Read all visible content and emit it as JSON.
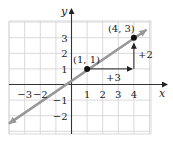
{
  "chart_data": {
    "type": "line",
    "title": "",
    "xlabel": "x",
    "ylabel": "y",
    "xlim": [
      -4,
      5
    ],
    "ylim": [
      -3,
      4
    ],
    "grid": true,
    "x_ticks": [
      -3,
      -2,
      1,
      2,
      3,
      4
    ],
    "x_tick_labels": [
      "−3",
      "−2",
      "1",
      "2",
      "3",
      "4"
    ],
    "y_ticks": [
      -2,
      -1,
      1,
      2,
      3
    ],
    "y_tick_labels": [
      "−2",
      "−1",
      "1",
      "2",
      "3"
    ],
    "series": [
      {
        "name": "line through (1, 1) and (4, 3)",
        "slope": "2/3",
        "x": [
          -4.0,
          4.8
        ],
        "y": [
          -2.5,
          3.5
        ],
        "color": "#999999"
      }
    ],
    "points": [
      {
        "x": 1,
        "y": 1,
        "label": "(1, 1)"
      },
      {
        "x": 4,
        "y": 3,
        "label": "(4, 3)"
      }
    ],
    "annotations": [
      {
        "type": "arrow",
        "from": [
          1,
          1
        ],
        "to": [
          4,
          1
        ],
        "label": "+3"
      },
      {
        "type": "arrow",
        "from": [
          4,
          1
        ],
        "to": [
          4,
          3
        ],
        "label": "+2"
      }
    ]
  },
  "colors": {
    "grid": "#d9d9d9",
    "axis": "#333333",
    "line": "#9a9a9a",
    "point": "#111111",
    "arrow": "#222222"
  }
}
